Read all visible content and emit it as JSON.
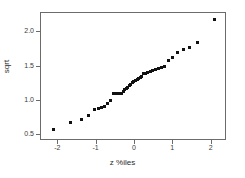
{
  "chart_data": {
    "type": "scatter",
    "title": "",
    "xlabel": "z %iles",
    "ylabel": "sqrt",
    "xlim": [
      -2.45,
      2.4
    ],
    "ylim": [
      0.42,
      2.28
    ],
    "grid": false,
    "legend": false,
    "xticks": [
      -2,
      -1,
      0,
      1,
      2
    ],
    "xticklabels": [
      "-2",
      "-1",
      "0",
      "1",
      "2"
    ],
    "yticks": [
      0.5,
      1.0,
      1.5,
      2.0
    ],
    "yticklabels": [
      "0.5",
      "1.0",
      "1.5",
      "2.0"
    ],
    "marker": "square",
    "marker_color": "#111111",
    "frame_color": "#6b6b6b",
    "series": [
      {
        "name": "sqrt vs z percentiles",
        "x": [
          -2.1,
          -1.65,
          -1.38,
          -1.18,
          -1.02,
          -0.93,
          -0.84,
          -0.76,
          -0.68,
          -0.6,
          -0.53,
          -0.47,
          -0.44,
          -0.4,
          -0.36,
          -0.32,
          -0.28,
          -0.24,
          -0.2,
          -0.16,
          -0.12,
          -0.08,
          -0.04,
          0.0,
          0.04,
          0.08,
          0.12,
          0.16,
          0.2,
          0.25,
          0.3,
          0.36,
          0.42,
          0.49,
          0.56,
          0.63,
          0.71,
          0.8,
          0.9,
          1.0,
          1.13,
          1.28,
          1.45,
          1.66,
          2.1
        ],
        "y": [
          0.57,
          0.68,
          0.72,
          0.77,
          0.87,
          0.88,
          0.89,
          0.9,
          0.95,
          1.0,
          1.09,
          1.09,
          1.09,
          1.09,
          1.09,
          1.1,
          1.12,
          1.15,
          1.17,
          1.19,
          1.21,
          1.23,
          1.25,
          1.27,
          1.28,
          1.3,
          1.31,
          1.33,
          1.34,
          1.38,
          1.39,
          1.4,
          1.41,
          1.43,
          1.44,
          1.46,
          1.47,
          1.49,
          1.58,
          1.62,
          1.69,
          1.73,
          1.76,
          1.84,
          2.17
        ]
      }
    ]
  }
}
